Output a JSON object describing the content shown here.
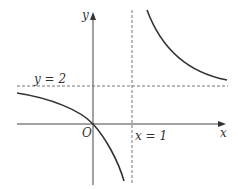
{
  "figure": {
    "type": "function-graph",
    "function": "y = 2x/(x-1)",
    "axes": {
      "x_label": "x",
      "y_label": "y",
      "origin_label": "O"
    },
    "asymptotes": [
      {
        "label": "y = 2",
        "orientation": "horizontal",
        "value": 2
      },
      {
        "label": "x = 1",
        "orientation": "vertical",
        "value": 1
      }
    ],
    "colors": {
      "curve": "#333333",
      "axis": "#444444",
      "asymptote": "#777777"
    }
  }
}
